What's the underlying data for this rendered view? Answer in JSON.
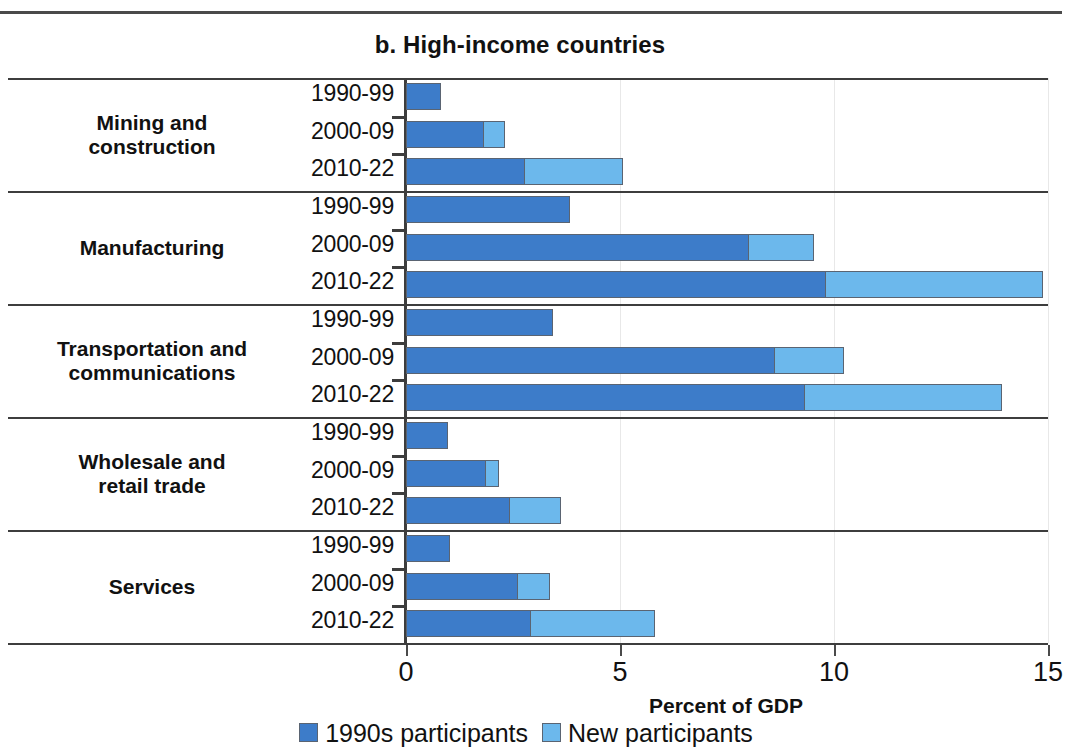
{
  "panel": {
    "title": "b. High-income countries"
  },
  "legend": {
    "items": [
      {
        "label": "1990s participants",
        "color": "#3d7cc9",
        "key": "old"
      },
      {
        "label": "New participants",
        "color": "#6cb8ec",
        "key": "new"
      }
    ]
  },
  "axis": {
    "x_title": "Percent of GDP",
    "x_ticks": [
      "0",
      "5",
      "10",
      "15"
    ]
  },
  "chart_data": {
    "type": "bar",
    "orientation": "horizontal",
    "stacked": true,
    "title": "b. High-income countries",
    "xlabel": "Percent of GDP",
    "ylabel": "",
    "xlim": [
      0,
      15
    ],
    "xticks": [
      0,
      5,
      10,
      15
    ],
    "grid": true,
    "legend_position": "bottom",
    "series": [
      {
        "name": "1990s participants",
        "color": "#3d7cc9"
      },
      {
        "name": "New participants",
        "color": "#6cb8ec"
      }
    ],
    "groups": [
      {
        "category": "Mining and construction",
        "rows": [
          {
            "period": "1990-99",
            "values": [
              0.8,
              0.0
            ],
            "total": 0.8
          },
          {
            "period": "2000-09",
            "values": [
              1.8,
              0.5
            ],
            "total": 2.3
          },
          {
            "period": "2010-22",
            "values": [
              2.75,
              2.3
            ],
            "total": 5.05
          }
        ]
      },
      {
        "category": "Manufacturing",
        "rows": [
          {
            "period": "1990-99",
            "values": [
              3.8,
              0.0
            ],
            "total": 3.8
          },
          {
            "period": "2000-09",
            "values": [
              8.0,
              1.5
            ],
            "total": 9.5
          },
          {
            "period": "2010-22",
            "values": [
              9.8,
              5.05
            ],
            "total": 14.85
          }
        ]
      },
      {
        "category": "Transportation and communications",
        "rows": [
          {
            "period": "1990-99",
            "values": [
              3.4,
              0.0
            ],
            "total": 3.4
          },
          {
            "period": "2000-09",
            "values": [
              8.6,
              1.6
            ],
            "total": 10.2
          },
          {
            "period": "2010-22",
            "values": [
              9.3,
              4.6
            ],
            "total": 13.9
          }
        ]
      },
      {
        "category": "Wholesale and retail trade",
        "rows": [
          {
            "period": "1990-99",
            "values": [
              0.95,
              0.0
            ],
            "total": 0.95
          },
          {
            "period": "2000-09",
            "values": [
              1.85,
              0.3
            ],
            "total": 2.15
          },
          {
            "period": "2010-22",
            "values": [
              2.4,
              1.2
            ],
            "total": 3.6
          }
        ]
      },
      {
        "category": "Services",
        "rows": [
          {
            "period": "1990-99",
            "values": [
              1.0,
              0.0
            ],
            "total": 1.0
          },
          {
            "period": "2000-09",
            "values": [
              2.6,
              0.75
            ],
            "total": 3.35
          },
          {
            "period": "2010-22",
            "values": [
              2.9,
              2.9
            ],
            "total": 5.8
          }
        ]
      }
    ]
  },
  "category_label_lines": [
    [
      "Mining and",
      "construction"
    ],
    [
      "Manufacturing"
    ],
    [
      "Transportation and",
      "communications"
    ],
    [
      "Wholesale and",
      "retail trade"
    ],
    [
      "Services"
    ]
  ]
}
